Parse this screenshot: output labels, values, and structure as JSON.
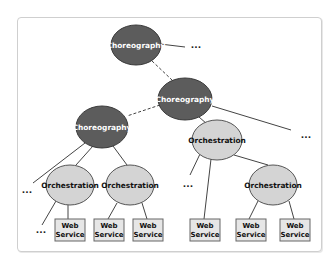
{
  "diagram": {
    "colors": {
      "choreography_fill": "#5c5c5c",
      "orchestration_fill": "#d4d4d4",
      "web_service_fill": "#e6e6e6",
      "stroke": "#444444"
    },
    "nodes": [
      {
        "id": "c1",
        "type": "choreography",
        "label": "Choreography"
      },
      {
        "id": "c2",
        "type": "choreography",
        "label": "Choreography"
      },
      {
        "id": "c3",
        "type": "choreography",
        "label": "Choreography"
      },
      {
        "id": "o1",
        "type": "orchestration",
        "label": "Orchestration"
      },
      {
        "id": "o2",
        "type": "orchestration",
        "label": "Orchestration"
      },
      {
        "id": "o3",
        "type": "orchestration",
        "label": "Orchestration"
      },
      {
        "id": "o4",
        "type": "orchestration",
        "label": "Orchestration"
      },
      {
        "id": "w1",
        "type": "web-service",
        "label_line1": "Web",
        "label_line2": "Service"
      },
      {
        "id": "w2",
        "type": "web-service",
        "label_line1": "Web",
        "label_line2": "Service"
      },
      {
        "id": "w3",
        "type": "web-service",
        "label_line1": "Web",
        "label_line2": "Service"
      },
      {
        "id": "w4",
        "type": "web-service",
        "label_line1": "Web",
        "label_line2": "Service"
      },
      {
        "id": "w5",
        "type": "web-service",
        "label_line1": "Web",
        "label_line2": "Service"
      },
      {
        "id": "w6",
        "type": "web-service",
        "label_line1": "Web",
        "label_line2": "Service"
      }
    ],
    "edges": [
      {
        "from": "c1",
        "to": "more1",
        "style": "solid"
      },
      {
        "from": "c1",
        "to": "c2",
        "style": "dashed"
      },
      {
        "from": "c2",
        "to": "c3",
        "style": "dashed"
      },
      {
        "from": "c2",
        "to": "o2",
        "style": "solid"
      },
      {
        "from": "c2",
        "to": "more2",
        "style": "solid"
      },
      {
        "from": "c3",
        "to": "more3",
        "style": "solid"
      },
      {
        "from": "c3",
        "to": "o1",
        "style": "solid"
      },
      {
        "from": "c3",
        "to": "o3",
        "style": "solid"
      },
      {
        "from": "o1",
        "to": "more4",
        "style": "solid"
      },
      {
        "from": "o1",
        "to": "w1",
        "style": "solid"
      },
      {
        "from": "o3",
        "to": "w2",
        "style": "solid"
      },
      {
        "from": "o3",
        "to": "w3",
        "style": "solid"
      },
      {
        "from": "o2",
        "to": "more5",
        "style": "solid"
      },
      {
        "from": "o2",
        "to": "w4",
        "style": "solid"
      },
      {
        "from": "o2",
        "to": "o4",
        "style": "solid"
      },
      {
        "from": "o4",
        "to": "w5",
        "style": "solid"
      },
      {
        "from": "o4",
        "to": "w6",
        "style": "solid"
      }
    ],
    "ellipsis_text": "..."
  }
}
